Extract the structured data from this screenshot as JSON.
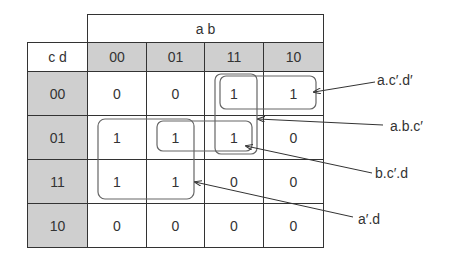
{
  "kmap": {
    "top_header": "a b",
    "corner_label": "c d",
    "columns": [
      "00",
      "01",
      "11",
      "10"
    ],
    "rows": [
      {
        "label": "00",
        "values": [
          "0",
          "0",
          "1",
          "1"
        ]
      },
      {
        "label": "01",
        "values": [
          "1",
          "1",
          "1",
          "0"
        ]
      },
      {
        "label": "11",
        "values": [
          "1",
          "1",
          "0",
          "0"
        ]
      },
      {
        "label": "10",
        "values": [
          "0",
          "0",
          "0",
          "0"
        ]
      }
    ]
  },
  "groups": [
    {
      "label": "a.c′.d′"
    },
    {
      "label": "a.b.c′"
    },
    {
      "label": "b.c′.d"
    },
    {
      "label": "a′.d"
    }
  ],
  "colors": {
    "header_fill": "#cfcfcf",
    "grid_line": "#333333",
    "group_outline": "#666666"
  }
}
